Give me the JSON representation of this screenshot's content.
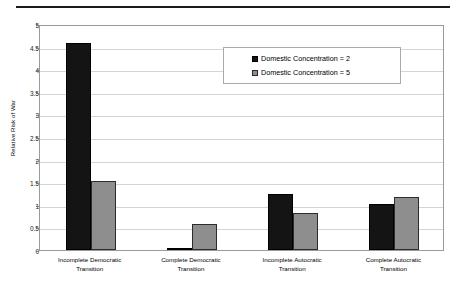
{
  "chart_data": {
    "type": "bar",
    "title": "",
    "xlabel": "",
    "ylabel": "Relative Risk of War",
    "ylim": [
      0,
      5
    ],
    "yticks": [
      0,
      0.5,
      1,
      1.5,
      2,
      2.5,
      3,
      3.5,
      4,
      4.5,
      5
    ],
    "ytick_labels": [
      "0",
      "0.5",
      "1",
      "1.5",
      "2",
      "2.5",
      "3",
      "3.5",
      "4",
      "4.5",
      "5"
    ],
    "grid": "horizontal",
    "legend_position": "upper-center-right",
    "categories": [
      "Incomplete Democratic Transition",
      "Complete Democratic Transition",
      "Incomplete Autocratic Transition",
      "Complete Autocratic Transition"
    ],
    "category_lines": [
      [
        "Incomplete Democratic",
        "Transition"
      ],
      [
        "Complete Democratic",
        "Transition"
      ],
      [
        "Incomplete Autocratic",
        "Transition"
      ],
      [
        "Complete Autocratic",
        "Transition"
      ]
    ],
    "series": [
      {
        "name": "Domestic Concentration = 2",
        "color": "#141414",
        "values": [
          4.58,
          0.03,
          1.24,
          1.02
        ]
      },
      {
        "name": "Domestic Concentration = 5",
        "color": "#8e8e8e",
        "values": [
          1.53,
          0.58,
          0.82,
          1.17
        ]
      }
    ]
  },
  "legend": {
    "entries": [
      "Domestic Concentration = 2",
      "Domestic Concentration = 5"
    ]
  },
  "colors": {
    "series_2": "#141414",
    "series_5": "#8e8e8e",
    "gridline": "#d4d4d4",
    "axis": "#9a9a9a",
    "rule": "#1a1a1a"
  }
}
